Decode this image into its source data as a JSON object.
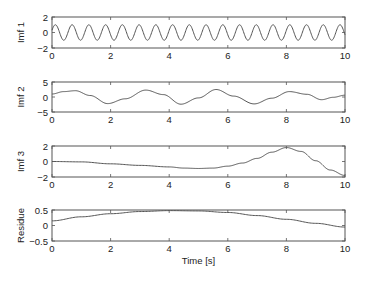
{
  "chart_data": [
    {
      "type": "line",
      "title": "",
      "ylabel": "Imf 1",
      "xlabel": "",
      "xlim": [
        0,
        10
      ],
      "ylim": [
        -2,
        2
      ],
      "xticks": [
        0,
        2,
        4,
        6,
        8,
        10
      ],
      "yticks": [
        -2,
        0,
        2
      ],
      "xtick_labels": [
        "0",
        "2",
        "4",
        "6",
        "8",
        "10"
      ],
      "ytick_labels": [
        "−2",
        "0",
        "2"
      ],
      "grid": false,
      "series": [
        {
          "name": "Imf 1",
          "kind": "sinusoid",
          "amplitude": 1.0,
          "frequency_hz": 1.75,
          "phase": 0.3
        }
      ]
    },
    {
      "type": "line",
      "title": "",
      "ylabel": "Imf 2",
      "xlabel": "",
      "xlim": [
        0,
        10
      ],
      "ylim": [
        -5,
        5
      ],
      "xticks": [
        0,
        2,
        4,
        6,
        8,
        10
      ],
      "yticks": [
        -5,
        0,
        5
      ],
      "xtick_labels": [
        "0",
        "2",
        "4",
        "6",
        "8",
        "10"
      ],
      "ytick_labels": [
        "−5",
        "0",
        "5"
      ],
      "grid": false,
      "series": [
        {
          "name": "Imf 2",
          "x": [
            0,
            0.4,
            0.8,
            1.3,
            1.9,
            2.5,
            3.2,
            3.8,
            4.4,
            5.0,
            5.6,
            6.2,
            6.9,
            7.5,
            8.1,
            8.7,
            9.2,
            9.6,
            10
          ],
          "y": [
            1.0,
            1.8,
            2.1,
            0.5,
            -2.2,
            -0.6,
            2.3,
            0.8,
            -2.4,
            -0.3,
            2.5,
            0.3,
            -2.3,
            -0.4,
            1.8,
            0.9,
            -0.9,
            -0.1,
            0.6
          ]
        }
      ]
    },
    {
      "type": "line",
      "title": "",
      "ylabel": "Imf 3",
      "xlabel": "",
      "xlim": [
        0,
        10
      ],
      "ylim": [
        -2,
        2
      ],
      "xticks": [
        0,
        2,
        4,
        6,
        8,
        10
      ],
      "yticks": [
        -2,
        0,
        2
      ],
      "xtick_labels": [
        "0",
        "2",
        "4",
        "6",
        "8",
        "10"
      ],
      "ytick_labels": [
        "−2",
        "0",
        "2"
      ],
      "grid": false,
      "series": [
        {
          "name": "Imf 3",
          "x": [
            0,
            1,
            2,
            3,
            4,
            4.5,
            5,
            5.5,
            6,
            6.5,
            7,
            7.5,
            8,
            8.5,
            9,
            9.5,
            10
          ],
          "y": [
            0.0,
            -0.05,
            -0.3,
            -0.5,
            -0.7,
            -0.85,
            -0.9,
            -0.85,
            -0.6,
            -0.2,
            0.4,
            1.2,
            1.8,
            1.3,
            0.1,
            -1.1,
            -1.8
          ]
        }
      ]
    },
    {
      "type": "line",
      "title": "",
      "ylabel": "Residue",
      "xlabel": "Time [s]",
      "xlim": [
        0,
        10
      ],
      "ylim": [
        -0.5,
        0.5
      ],
      "xticks": [
        0,
        2,
        4,
        6,
        8,
        10
      ],
      "yticks": [
        -0.5,
        0,
        0.5
      ],
      "xtick_labels": [
        "0",
        "2",
        "4",
        "6",
        "8",
        "10"
      ],
      "ytick_labels": [
        "−0.5",
        "0",
        "0.5"
      ],
      "grid": false,
      "series": [
        {
          "name": "Residue",
          "x": [
            0,
            1,
            2,
            3,
            4,
            5,
            6,
            7,
            8,
            9,
            10
          ],
          "y": [
            0.15,
            0.28,
            0.38,
            0.45,
            0.48,
            0.47,
            0.42,
            0.32,
            0.2,
            0.07,
            -0.05
          ]
        }
      ]
    }
  ]
}
